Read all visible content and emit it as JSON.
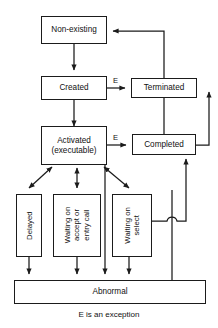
{
  "diagram": {
    "caption": "E is an exception",
    "stroke_color": "#1b1b1b",
    "background_color": "#ffffff",
    "nodes": {
      "non_existing": "Non-existing",
      "created": "Created",
      "terminated": "Terminated",
      "activated": "Activated\n(executable)",
      "completed": "Completed",
      "delayed": "Delayed",
      "waiting_accept": "Waiting on\naccept or\nentry call",
      "waiting_select": "Waiting on\nselect",
      "abnormal": "Abnormal"
    },
    "edge_labels": {
      "created_to_terminated": "E",
      "activated_to_completed": "E"
    }
  }
}
